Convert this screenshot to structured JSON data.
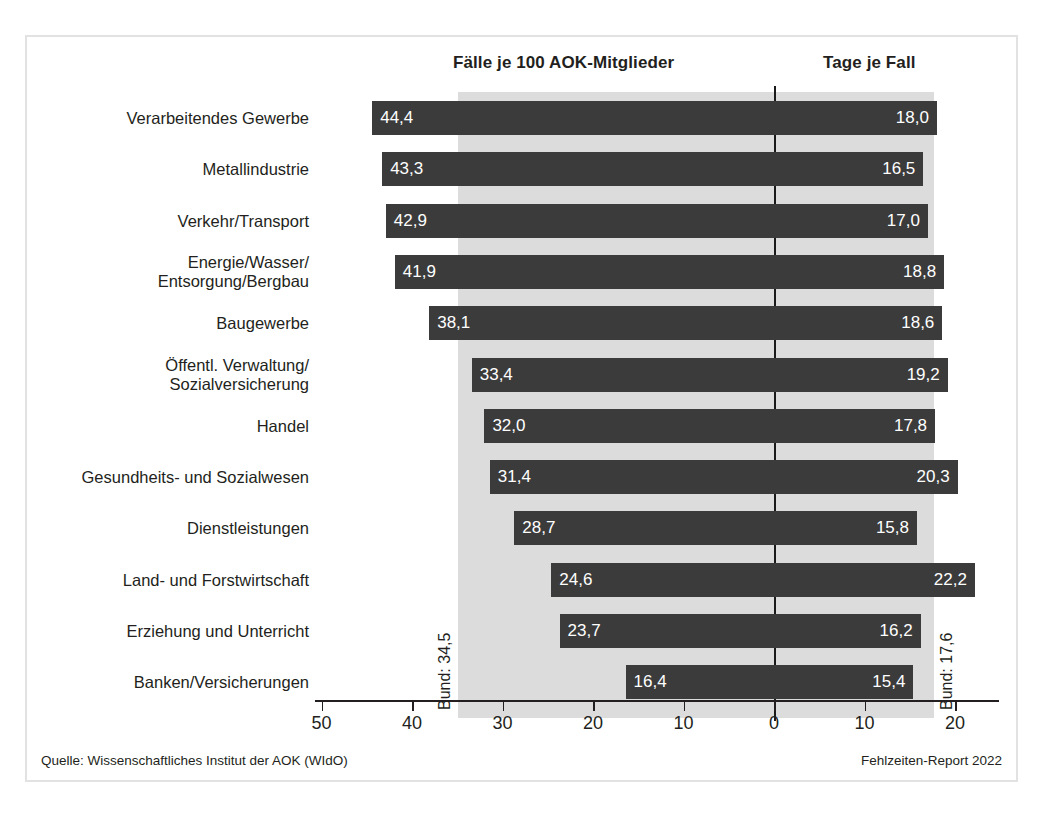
{
  "headers": {
    "left": "Fälle je 100 AOK-Mitglieder",
    "right": "Tage je Fall"
  },
  "annotations": {
    "bund_left": "Bund: 34,5",
    "bund_right": "Bund: 17,6"
  },
  "footer": {
    "source": "Quelle: Wissenschaftliches Institut der AOK (WIdO)",
    "report": "Fehlzeiten-Report 2022"
  },
  "axis": {
    "tick_labels": [
      "50",
      "40",
      "30",
      "20",
      "10",
      "0",
      "10",
      "20"
    ],
    "tick_values": [
      -50,
      -40,
      -30,
      -20,
      -10,
      0,
      10,
      20
    ]
  },
  "colors": {
    "bar": "#3b3b3b",
    "band": "#dcdcdc",
    "text": "#231f20",
    "frame": "#e2e2e2",
    "bar_label": "#ffffff"
  },
  "chart_data": {
    "type": "bar",
    "title": "",
    "subtitle": "",
    "orientation": "horizontal",
    "layout": "diverging-bidirectional",
    "xlabel": "",
    "ylabel": "",
    "xlim": [
      -50,
      25
    ],
    "grid": false,
    "legend": "none",
    "categories": [
      "Verarbeitendes Gewerbe",
      "Metallindustrie",
      "Verkehr/Transport",
      "Energie/Wasser/\nEntsorgung/Bergbau",
      "Baugewerbe",
      "Öffentl. Verwaltung/\nSozialversicherung",
      "Handel",
      "Gesundheits- und Sozialwesen",
      "Dienstleistungen",
      "Land- und Forstwirtschaft",
      "Erziehung und Unterricht",
      "Banken/Versicherungen"
    ],
    "series": [
      {
        "name": "Fälle je 100 AOK-Mitglieder",
        "side": "left",
        "values": [
          44.4,
          43.3,
          42.9,
          41.9,
          38.1,
          33.4,
          32.0,
          31.4,
          28.7,
          24.6,
          23.7,
          16.4
        ],
        "labels": [
          "44,4",
          "43,3",
          "42,9",
          "41,9",
          "38,1",
          "33,4",
          "32,0",
          "31,4",
          "28,7",
          "24,6",
          "23,7",
          "16,4"
        ],
        "reference_value": 34.5,
        "reference_label": "Bund: 34,5"
      },
      {
        "name": "Tage je Fall",
        "side": "right",
        "values": [
          18.0,
          16.5,
          17.0,
          18.8,
          18.6,
          19.2,
          17.8,
          20.3,
          15.8,
          22.2,
          16.2,
          15.4
        ],
        "labels": [
          "18,0",
          "16,5",
          "17,0",
          "18,8",
          "18,6",
          "19,2",
          "17,8",
          "20,3",
          "15,8",
          "22,2",
          "16,2",
          "15,4"
        ],
        "reference_value": 17.6,
        "reference_label": "Bund: 17,6"
      }
    ]
  }
}
